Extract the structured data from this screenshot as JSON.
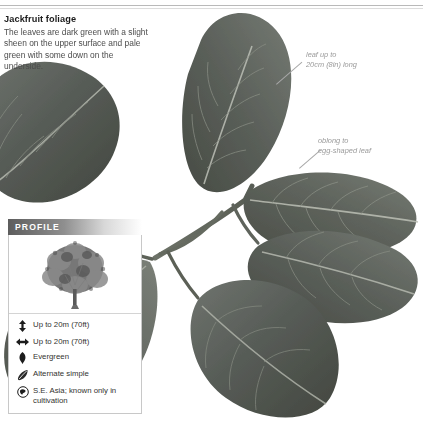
{
  "caption": {
    "title": "Jackfruit foliage",
    "body": "The leaves are dark green with a slight sheen on the upper surface and pale green with some down on the underside."
  },
  "annotations": [
    {
      "name": "leaf-size-callout",
      "text": "leaf up to\n20cm (8in) long"
    },
    {
      "name": "leaf-shape-callout",
      "text": "oblong to\negg-shaped leaf"
    }
  ],
  "profile": {
    "header_label": "PROFILE",
    "tree_image_alt": "tree-silhouette",
    "rows": [
      {
        "icon": "height-arrow-icon",
        "text": "Up to 20m (70ft)"
      },
      {
        "icon": "spread-arrow-icon",
        "text": "Up to 20m (70ft)"
      },
      {
        "icon": "evergreen-leaf-icon",
        "text": "Evergreen"
      },
      {
        "icon": "leaf-arrangement-icon",
        "text": "Alternate simple"
      },
      {
        "icon": "origin-globe-icon",
        "text": "S.E. Asia; known only in cultivation"
      }
    ]
  },
  "colors": {
    "leaf_dark": "#4c504c",
    "leaf_mid": "#5c615c",
    "leaf_light": "#6e736d",
    "midrib": "#b9bdb4",
    "text_body": "#4c4c4c",
    "annotation": "#9a9a9a"
  }
}
